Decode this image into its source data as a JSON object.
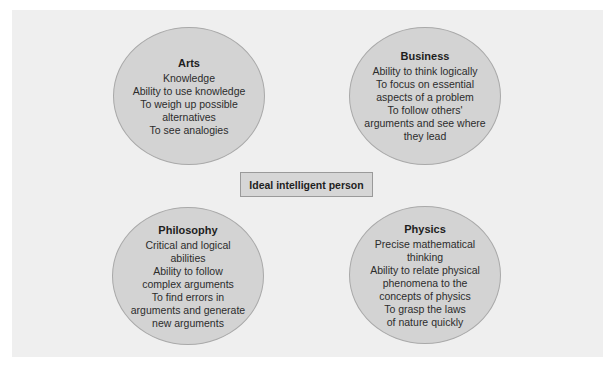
{
  "diagram": {
    "center": {
      "label": "Ideal intelligent person"
    },
    "nodes": [
      {
        "id": "arts",
        "title": "Arts",
        "lines": [
          "Knowledge",
          "Ability to use knowledge",
          "To weigh up possible",
          "alternatives",
          "To see analogies"
        ]
      },
      {
        "id": "business",
        "title": "Business",
        "lines": [
          "Ability to think logically",
          "To focus on essential",
          "aspects of a problem",
          "To follow others'",
          "arguments and see where",
          "they lead"
        ]
      },
      {
        "id": "philosophy",
        "title": "Philosophy",
        "lines": [
          "Critical and logical",
          "abilities",
          "Ability to follow",
          "complex arguments",
          "To find errors in",
          "arguments and generate",
          "new arguments"
        ]
      },
      {
        "id": "physics",
        "title": "Physics",
        "lines": [
          "Precise mathematical",
          "thinking",
          "Ability to relate physical",
          "phenomena to the",
          "concepts of physics",
          "To grasp the laws",
          "of nature quickly"
        ]
      }
    ],
    "colors": {
      "page_background": "#ffffff",
      "panel_background": "#efefef",
      "circle_fill": "#d3d3d3",
      "circle_border": "#a9a9a9",
      "center_box_fill": "#d6d6d6",
      "center_box_border": "#9a9a9a",
      "text": "#2a2a2a"
    }
  }
}
